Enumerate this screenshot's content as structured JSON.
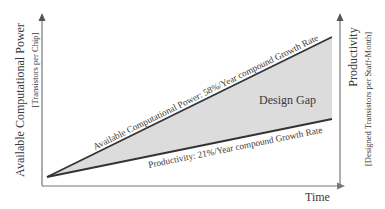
{
  "diagram": {
    "type": "design-gap-chart",
    "y_axis_left": {
      "title": "Available Computational Power",
      "subtitle": "[Transistors per Chip]"
    },
    "y_axis_right": {
      "title": "Productivity",
      "subtitle": "[Designed Transistors per Staff-Month]"
    },
    "x_axis": {
      "title": "Time"
    },
    "lines": [
      {
        "name": "computational-power",
        "label": "Available Computational Power: 58%/Year compound Growth Rate"
      },
      {
        "name": "productivity",
        "label": "Productivity: 21%/Year compound Growth Rate"
      }
    ],
    "region_label": "Design Gap",
    "colors": {
      "fill": "#dcdcdc",
      "line": "#333333",
      "axis": "#777777"
    }
  }
}
